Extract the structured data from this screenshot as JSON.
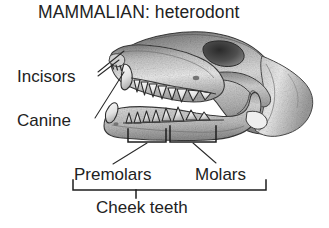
{
  "figure": {
    "title": "MAMMALIAN: heterodont",
    "background_color": "#ffffff",
    "ink_color": "#222222"
  },
  "labels": {
    "incisors": "Incisors",
    "canine": "Canine",
    "premolars": "Premolars",
    "molars": "Molars",
    "cheek_teeth": "Cheek teeth"
  },
  "annotations": {
    "incisors_leader_count": 2,
    "canine_leader_count": 1,
    "premolar_bracket": true,
    "molar_bracket": true,
    "cheek_teeth_bracket": true
  }
}
